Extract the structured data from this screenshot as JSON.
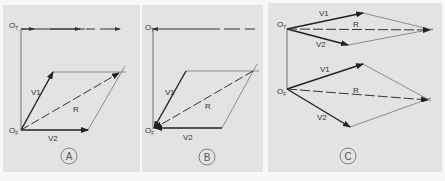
{
  "figure": {
    "colors": {
      "background": "#f7f7f7",
      "panel": "#e3e3e3",
      "line": "#333333",
      "thin_line": "#666666"
    }
  },
  "panels": [
    {
      "id": "A",
      "label": "A",
      "origin_top_label": "O",
      "origin_top_sub": "T",
      "origin_front_label": "O",
      "origin_front_sub": "F",
      "v1_label": "V1",
      "v2_label": "V2",
      "r_label": "R"
    },
    {
      "id": "B",
      "label": "B",
      "origin_top_label": "O",
      "origin_top_sub": "T",
      "origin_front_label": "O",
      "origin_front_sub": "F",
      "v1_label": "V1",
      "v2_label": "V2",
      "r_label": "R"
    },
    {
      "id": "C",
      "label": "C",
      "origin_top_label": "O",
      "origin_top_sub": "T",
      "origin_front_label": "O",
      "origin_front_sub": "F",
      "top_v1_label": "V1",
      "top_v2_label": "V2",
      "top_r_label": "R",
      "front_v1_label": "V1",
      "front_v2_label": "V2",
      "front_r_label": "R"
    }
  ]
}
